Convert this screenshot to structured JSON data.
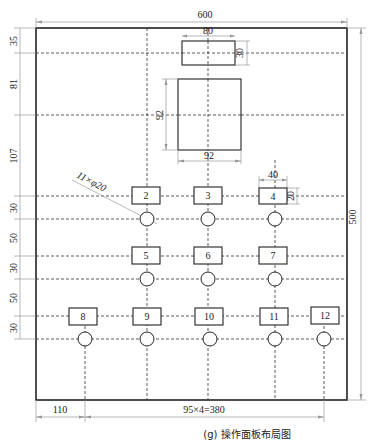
{
  "caption": "(g) 操作面板布局图",
  "dimensions": {
    "width_total": "600",
    "height_total": "500",
    "top_box_width": "80",
    "top_box_height": "30",
    "big_box_height": "92",
    "big_box_width": "92",
    "button_width": "40",
    "button_height": "20",
    "left_offsets": [
      "35",
      "81",
      "107",
      "30",
      "50",
      "30",
      "50",
      "30"
    ],
    "bottom_left": "110",
    "bottom_spacing": "95×4=380",
    "holes_note": "11×φ20"
  },
  "buttons": [
    {
      "id": "2",
      "label": "2"
    },
    {
      "id": "3",
      "label": "3"
    },
    {
      "id": "4",
      "label": "4"
    },
    {
      "id": "5",
      "label": "5"
    },
    {
      "id": "6",
      "label": "6"
    },
    {
      "id": "7",
      "label": "7"
    },
    {
      "id": "8",
      "label": "8"
    },
    {
      "id": "9",
      "label": "9"
    },
    {
      "id": "10",
      "label": "10"
    },
    {
      "id": "11",
      "label": "11"
    },
    {
      "id": "12",
      "label": "12"
    }
  ]
}
